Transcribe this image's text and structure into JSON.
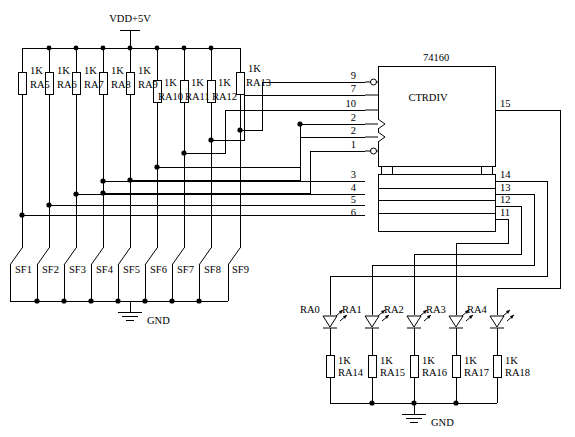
{
  "diagram": {
    "title_ic": "74160",
    "ic_function": "CTRDIV",
    "power_label": "VDD+5V",
    "gnd_label_left": "GND",
    "gnd_label_right": "GND",
    "ohm_label": "1K"
  },
  "pullup_resistors": [
    {
      "value": "1K",
      "ref": "RA5"
    },
    {
      "value": "1K",
      "ref": "RA6"
    },
    {
      "value": "1K",
      "ref": "RA7"
    },
    {
      "value": "1K",
      "ref": "RA8"
    },
    {
      "value": "1K",
      "ref": "RA9"
    },
    {
      "value": "1K",
      "ref": "RA10"
    },
    {
      "value": "1K",
      "ref": "RA11"
    },
    {
      "value": "1K",
      "ref": "RA12"
    },
    {
      "value": "1K",
      "ref": "RA13"
    }
  ],
  "switches": [
    {
      "ref": "SF1"
    },
    {
      "ref": "SF2"
    },
    {
      "ref": "SF3"
    },
    {
      "ref": "SF4"
    },
    {
      "ref": "SF5"
    },
    {
      "ref": "SF6"
    },
    {
      "ref": "SF7"
    },
    {
      "ref": "SF8"
    },
    {
      "ref": "SF9"
    }
  ],
  "ic_pins_left_top": [
    "9",
    "7",
    "10",
    "2",
    "2",
    "1"
  ],
  "ic_pins_left_bottom": [
    "3",
    "4",
    "5",
    "6"
  ],
  "ic_pins_right_top": [
    "15"
  ],
  "ic_pins_right_bottom": [
    "14",
    "13",
    "12",
    "11"
  ],
  "leds": [
    {
      "ref": "RA0"
    },
    {
      "ref": "RA1"
    },
    {
      "ref": "RA2"
    },
    {
      "ref": "RA3"
    },
    {
      "ref": "RA4"
    }
  ],
  "led_resistors": [
    {
      "value": "1K",
      "ref": "RA14"
    },
    {
      "value": "1K",
      "ref": "RA15"
    },
    {
      "value": "1K",
      "ref": "RA16"
    },
    {
      "value": "1K",
      "ref": "RA17"
    },
    {
      "value": "1K",
      "ref": "RA18"
    }
  ]
}
